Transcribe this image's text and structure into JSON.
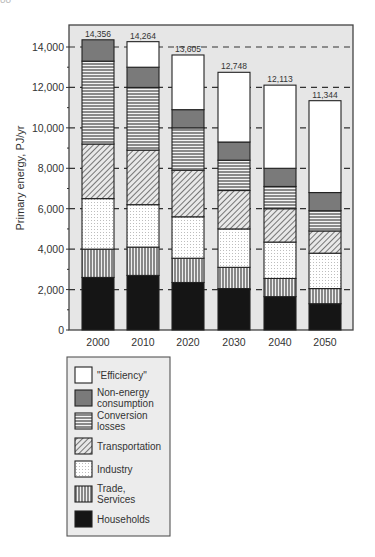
{
  "page": {
    "page_number_fragment": "88"
  },
  "chart_data": {
    "type": "bar",
    "stacked": true,
    "title": "",
    "xlabel": "",
    "ylabel": "Primary energy, PJ/yr",
    "ylim": [
      0,
      15000
    ],
    "yticks": [
      0,
      2000,
      4000,
      6000,
      8000,
      10000,
      12000,
      14000
    ],
    "ytick_labels": [
      "0",
      "2,000",
      "4,000",
      "6,000",
      "8,000",
      "10,000",
      "12,000",
      "14,000"
    ],
    "grid": "dashed horizontal at major ticks",
    "categories": [
      "2000",
      "2010",
      "2020",
      "2030",
      "2040",
      "2050"
    ],
    "totals": [
      14356,
      14264,
      13605,
      12748,
      12113,
      11344
    ],
    "total_labels": [
      "14,356",
      "14,264",
      "13,605",
      "12,748",
      "12,113",
      "11,344"
    ],
    "series": [
      {
        "name": "Households",
        "pattern": "solid-black",
        "values": [
          2600,
          2700,
          2350,
          2050,
          1650,
          1300
        ]
      },
      {
        "name": "Trade, Services",
        "pattern": "vertical-lines",
        "values": [
          1400,
          1400,
          1200,
          1050,
          900,
          750
        ]
      },
      {
        "name": "Industry",
        "pattern": "dots",
        "values": [
          2500,
          2100,
          2050,
          1900,
          1800,
          1750
        ]
      },
      {
        "name": "Transportation",
        "pattern": "diagonal-hatch",
        "values": [
          2700,
          2700,
          2300,
          1900,
          1650,
          1100
        ]
      },
      {
        "name": "Conversion losses",
        "pattern": "horizontal-lines",
        "values": [
          4100,
          3100,
          2100,
          1500,
          1100,
          1000
        ]
      },
      {
        "name": "Non-energy consumption",
        "pattern": "solid-gray",
        "values": [
          1056,
          1000,
          900,
          900,
          900,
          900
        ]
      },
      {
        "name": "\"Efficiency\"",
        "pattern": "white",
        "values": [
          0,
          1264,
          2705,
          3448,
          4113,
          4544
        ]
      }
    ],
    "legend": {
      "position": "below-left",
      "entries": [
        {
          "label_lines": [
            "\"Efficiency\""
          ],
          "pattern": "white"
        },
        {
          "label_lines": [
            "Non-energy",
            "consumption"
          ],
          "pattern": "solid-gray"
        },
        {
          "label_lines": [
            "Conversion",
            "losses"
          ],
          "pattern": "horizontal-lines"
        },
        {
          "label_lines": [
            "Transportation"
          ],
          "pattern": "diagonal-hatch"
        },
        {
          "label_lines": [
            "Industry"
          ],
          "pattern": "dots"
        },
        {
          "label_lines": [
            "Trade,",
            "Services"
          ],
          "pattern": "vertical-lines"
        },
        {
          "label_lines": [
            "Households"
          ],
          "pattern": "solid-black"
        }
      ]
    },
    "colors": {
      "plot_bg": "#e6e6e6",
      "frame": "#444444",
      "non_energy": "#7a7a7a",
      "households": "#151515",
      "hatch": "#3a3a3a"
    }
  }
}
